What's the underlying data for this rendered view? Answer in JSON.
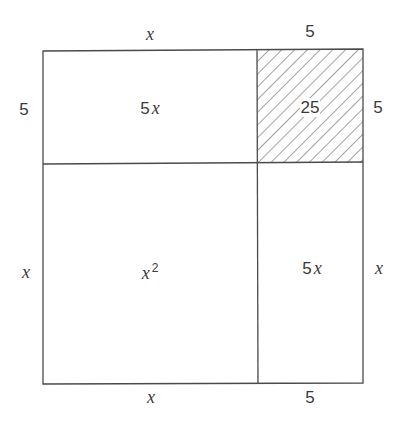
{
  "figure": {
    "top_labels": {
      "left": "x",
      "right": "5"
    },
    "bottom_labels": {
      "left": "x",
      "right": "5"
    },
    "left_labels": {
      "top": "5",
      "bottom": "x"
    },
    "right_labels": {
      "top": "5",
      "bottom": "x"
    },
    "regions": {
      "top_left": {
        "coef": "5",
        "var": "x",
        "text": "5x"
      },
      "top_right": {
        "text": "25",
        "shaded": true,
        "pattern": "diagonal-hatch"
      },
      "bottom_left": {
        "var": "x",
        "exp": "2",
        "text": "x^2"
      },
      "bottom_right": {
        "coef": "5",
        "var": "x",
        "text": "5x"
      }
    },
    "colors": {
      "stroke": "#4a4a4a",
      "hatch": "#555555",
      "background": "#ffffff"
    }
  }
}
